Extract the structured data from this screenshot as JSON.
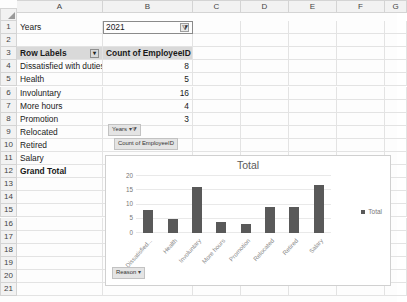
{
  "spreadsheet": {
    "columns": [
      "A",
      "B",
      "C",
      "D",
      "E",
      "F",
      "G"
    ],
    "rows": [
      "1",
      "2",
      "3",
      "4",
      "5",
      "6",
      "7",
      "8",
      "9",
      "10",
      "11",
      "12",
      "13",
      "14",
      "15",
      "16",
      "17",
      "18",
      "19",
      "20",
      "21"
    ],
    "cells": {
      "a1": "Years",
      "b1": "2021",
      "b1_filter_icon": "filter-applied-icon",
      "a3": "Row Labels",
      "a3_dropdown_icon": "chevron-down-icon",
      "b3": "Count of EmployeeID",
      "a4": "Dissatisfied with duties",
      "b4": "8",
      "a5": "Health",
      "b5": "5",
      "a6": "Involuntary",
      "b6": "16",
      "a7": "More hours",
      "b7": "4",
      "a8": "Promotion",
      "b8": "3",
      "a9": "Relocated",
      "a10": "Retired",
      "a11": "Salary",
      "a12": "Grand Total"
    }
  },
  "pivot_buttons": [
    {
      "label": "Years",
      "icon": "filter-applied-icon"
    },
    {
      "label": "Count of EmployeeID",
      "icon": ""
    },
    {
      "label": "Reason",
      "icon": "chevron-down-icon"
    }
  ],
  "chart_data": {
    "type": "bar",
    "title": "Total",
    "xlabel": "",
    "ylabel": "",
    "categories": [
      "Dissatisfied with duties",
      "Health",
      "Involuntary",
      "More hours",
      "Promotion",
      "Relocated",
      "Retired",
      "Salary"
    ],
    "values": [
      8,
      5,
      16,
      4,
      3,
      9,
      9,
      17
    ],
    "series": [
      {
        "name": "Total",
        "values": [
          8,
          5,
          16,
          4,
          3,
          9,
          9,
          17
        ]
      }
    ],
    "ylim": [
      0,
      20
    ],
    "yticks": [
      "20",
      "15",
      "10",
      "5",
      "0"
    ],
    "legend": [
      "Total"
    ],
    "legend_position": "right",
    "grid": true,
    "bar_color": "#595959"
  }
}
